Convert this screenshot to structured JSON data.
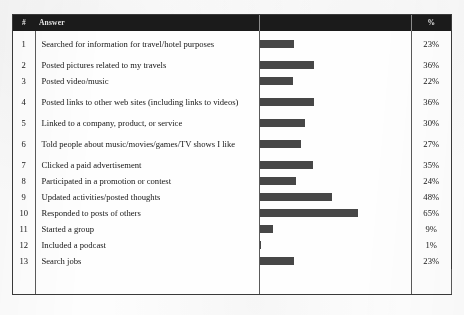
{
  "table": {
    "headers": {
      "number": "#",
      "answer": "Answer",
      "chart": "",
      "percent": "%"
    },
    "rows": [
      {
        "num": "1",
        "answer": "Searched for information for travel/hotel purposes",
        "percent": "23%",
        "value": 23
      },
      {
        "num": "2",
        "answer": "Posted pictures related to my travels",
        "percent": "36%",
        "value": 36
      },
      {
        "num": "3",
        "answer": "Posted video/music",
        "percent": "22%",
        "value": 22
      },
      {
        "num": "4",
        "answer": "Posted links to other web sites (including links to videos)",
        "percent": "36%",
        "value": 36
      },
      {
        "num": "5",
        "answer": "Linked to a company, product, or service",
        "percent": "30%",
        "value": 30
      },
      {
        "num": "6",
        "answer": "Told people about music/movies/games/TV shows I like",
        "percent": "27%",
        "value": 27
      },
      {
        "num": "7",
        "answer": "Clicked a paid advertisement",
        "percent": "35%",
        "value": 35
      },
      {
        "num": "8",
        "answer": "Participated in a promotion or contest",
        "percent": "24%",
        "value": 24
      },
      {
        "num": "9",
        "answer": "Updated activities/posted thoughts",
        "percent": "48%",
        "value": 48
      },
      {
        "num": "10",
        "answer": "Responded to posts of others",
        "percent": "65%",
        "value": 65
      },
      {
        "num": "11",
        "answer": "Started a group",
        "percent": "9%",
        "value": 9
      },
      {
        "num": "12",
        "answer": "Included a podcast",
        "percent": "1%",
        "value": 1
      },
      {
        "num": "13",
        "answer": "Search jobs",
        "percent": "23%",
        "value": 23
      }
    ]
  },
  "chart_data": {
    "type": "bar",
    "title": "",
    "xlabel": "",
    "ylabel": "",
    "orientation": "horizontal",
    "grid": false,
    "legend": "none",
    "xlim": [
      0,
      100
    ],
    "unit": "percent",
    "bar_color": "#474747",
    "categories": [
      "Searched for information for travel/hotel purposes",
      "Posted pictures related to my travels",
      "Posted video/music",
      "Posted links to other web sites (including links to videos)",
      "Linked to a company, product, or service",
      "Told people about music/movies/games/TV shows I like",
      "Clicked a paid advertisement",
      "Participated in a promotion or contest",
      "Updated activities/posted thoughts",
      "Responded to posts of others",
      "Started a group",
      "Included a podcast",
      "Search jobs"
    ],
    "values": [
      23,
      36,
      22,
      36,
      30,
      27,
      35,
      24,
      48,
      65,
      9,
      1,
      23
    ]
  },
  "style": {
    "header_bg": "#1b1b1b",
    "header_fg": "#e8e8e8",
    "bar_color": "#474747",
    "border_color": "#3a3a3a",
    "max_value": 100
  }
}
